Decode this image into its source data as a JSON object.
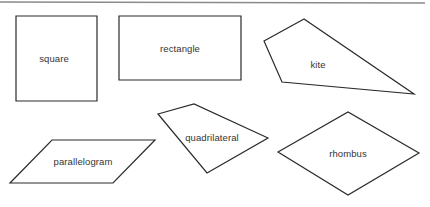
{
  "diagram": {
    "colors": {
      "stroke": "#2a2a2a",
      "fill": "#ffffff",
      "rule": "#8a8a8a",
      "text": "#333333"
    },
    "shapes": [
      {
        "id": "square",
        "label": "square",
        "points": "16,16 97,16 97,101 16,101",
        "label_pos": [
          54,
          58
        ]
      },
      {
        "id": "rectangle",
        "label": "rectangle",
        "points": "119,16 241,16 241,80 119,80",
        "label_pos": [
          180,
          48
        ]
      },
      {
        "id": "kite",
        "label": "kite",
        "points": "304,19 264,41 282,82 414,94",
        "label_pos": [
          318,
          64
        ]
      },
      {
        "id": "parallelogram",
        "label": "parallelogram",
        "points": "52,140 155,140 113,183 10,183",
        "label_pos": [
          83,
          161
        ]
      },
      {
        "id": "quadrilateral",
        "label": "quadrilateral",
        "points": "158,114 194,104 268,138 207,173",
        "label_pos": [
          212,
          137
        ]
      },
      {
        "id": "rhombus",
        "label": "rhombus",
        "points": "278,152 348,112 419,153 348,195",
        "label_pos": [
          348,
          153
        ]
      }
    ]
  }
}
